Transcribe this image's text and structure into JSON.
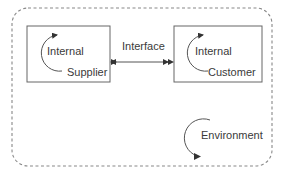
{
  "diagram": {
    "boundary": {
      "style": "dashed-rounded",
      "color": "#777777"
    },
    "interface": {
      "label": "Interface",
      "arrow": "bidirectional"
    },
    "supplier": {
      "line1": "Internal",
      "line2": "Supplier"
    },
    "customer": {
      "line1": "Internal",
      "line2": "Customer"
    },
    "environment": {
      "label": "Environment"
    },
    "colors": {
      "stroke": "#555555",
      "text": "#3a3a3a",
      "dash": "#888888"
    }
  }
}
